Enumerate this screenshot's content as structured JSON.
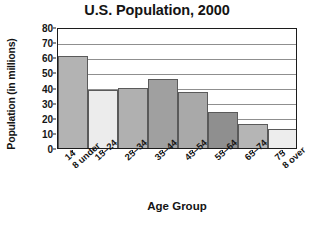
{
  "chart_data": {
    "type": "bar",
    "title": "U.S. Population, 2000",
    "xlabel": "Age Group",
    "ylabel": "Population (in millions)",
    "categories": [
      "14 & under",
      "15–24",
      "25–34",
      "35–44",
      "45–54",
      "55–64",
      "65–74",
      "75 & over"
    ],
    "category_lines": [
      [
        "14",
        "8 under"
      ],
      [
        "15–24",
        ""
      ],
      [
        "25–34",
        ""
      ],
      [
        "35–44",
        ""
      ],
      [
        "45–54",
        ""
      ],
      [
        "55–64",
        ""
      ],
      [
        "65–74",
        ""
      ],
      [
        "75",
        "8 over"
      ]
    ],
    "values": [
      61,
      38.5,
      40,
      45.5,
      37,
      24,
      16,
      12.5
    ],
    "ylim": [
      0,
      80
    ],
    "ytick_labels": [
      "0",
      "10",
      "20",
      "30",
      "40",
      "50",
      "60",
      "70",
      "80"
    ],
    "ytick_values": [
      0,
      10,
      20,
      30,
      40,
      50,
      60,
      70,
      80
    ],
    "grid": "horizontal",
    "legend": "none",
    "bar_colors": [
      "#b3b3b3",
      "#ececec",
      "#b0b0b0",
      "#a0a0a0",
      "#a9a9a9",
      "#8f8f8f",
      "#b5b5b5",
      "#ededed"
    ],
    "bar_border_color": "#5a5a5a",
    "gridline_color": "#8f8f8f",
    "axis_color": "#1c1c1c",
    "text_color": "#141414",
    "background": "#ffffff"
  }
}
